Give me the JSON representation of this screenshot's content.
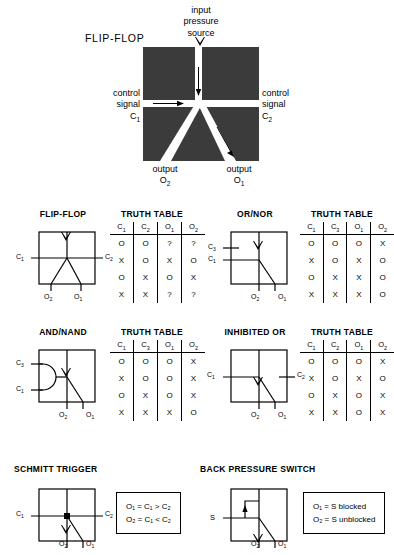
{
  "hero": {
    "title": "FLIP-FLOP",
    "input_label_line1": "input",
    "input_label_line2": "pressure",
    "input_label_line3": "source",
    "control_left_line1": "control",
    "control_left_line2": "signal",
    "control_left_line3": "C",
    "control_left_sub": "1",
    "control_right_line1": "control",
    "control_right_line2": "signal",
    "control_right_line3": "C",
    "control_right_sub": "2",
    "output_left_line1": "output",
    "output_left_line2": "O",
    "output_left_sub": "2",
    "output_right_line1": "output",
    "output_right_line2": "O",
    "output_right_sub": "1",
    "body_color": "#3b3b3b",
    "channel_color": "#ffffff"
  },
  "truth_table_heading": "TRUTH TABLE",
  "cells": {
    "flipflop": {
      "title": "FLIP-FLOP",
      "in_left": "C",
      "in_left_sub": "1",
      "in_right": "C",
      "in_right_sub": "2",
      "out_left": "O",
      "out_left_sub": "2",
      "out_right": "O",
      "out_right_sub": "1",
      "table": {
        "headers": [
          {
            "base": "C",
            "sub": "1"
          },
          {
            "base": "C",
            "sub": "2"
          },
          {
            "base": "O",
            "sub": "1"
          },
          {
            "base": "O",
            "sub": "2"
          }
        ],
        "rows": [
          [
            "O",
            "O",
            "?",
            "?"
          ],
          [
            "X",
            "O",
            "X",
            "O"
          ],
          [
            "O",
            "X",
            "O",
            "X"
          ],
          [
            "X",
            "X",
            "?",
            "?"
          ]
        ]
      }
    },
    "ornor": {
      "title": "OR/NOR",
      "in_upper": "C",
      "in_upper_sub": "3",
      "in_lower": "C",
      "in_lower_sub": "1",
      "out_left": "O",
      "out_left_sub": "2",
      "out_right": "O",
      "out_right_sub": "1",
      "table": {
        "headers": [
          {
            "base": "C",
            "sub": "1"
          },
          {
            "base": "C",
            "sub": "3"
          },
          {
            "base": "O",
            "sub": "1"
          },
          {
            "base": "O",
            "sub": "2"
          }
        ],
        "rows": [
          [
            "O",
            "O",
            "O",
            "X"
          ],
          [
            "X",
            "O",
            "X",
            "O"
          ],
          [
            "O",
            "X",
            "X",
            "O"
          ],
          [
            "X",
            "X",
            "X",
            "O"
          ]
        ]
      }
    },
    "andnand": {
      "title": "AND/NAND",
      "in_upper": "C",
      "in_upper_sub": "3",
      "in_lower": "C",
      "in_lower_sub": "1",
      "out_left": "O",
      "out_left_sub": "2",
      "out_right": "O",
      "out_right_sub": "1",
      "table": {
        "headers": [
          {
            "base": "C",
            "sub": "1"
          },
          {
            "base": "C",
            "sub": "3"
          },
          {
            "base": "O",
            "sub": "1"
          },
          {
            "base": "O",
            "sub": "2"
          }
        ],
        "rows": [
          [
            "O",
            "O",
            "O",
            "X"
          ],
          [
            "X",
            "O",
            "O",
            "X"
          ],
          [
            "O",
            "X",
            "O",
            "X"
          ],
          [
            "X",
            "X",
            "X",
            "O"
          ]
        ]
      }
    },
    "inhibited_or": {
      "title": "INHIBITED OR",
      "in_left": "C",
      "in_left_sub": "1",
      "in_right": "C",
      "in_right_sub": "2",
      "out_left": "O",
      "out_left_sub": "2",
      "out_right": "O",
      "out_right_sub": "1",
      "table": {
        "headers": [
          {
            "base": "C",
            "sub": "1"
          },
          {
            "base": "C",
            "sub": "2"
          },
          {
            "base": "O",
            "sub": "1"
          },
          {
            "base": "O",
            "sub": "2"
          }
        ],
        "rows": [
          [
            "O",
            "O",
            "O",
            "X"
          ],
          [
            "X",
            "O",
            "X",
            "O"
          ],
          [
            "O",
            "X",
            "O",
            "X"
          ],
          [
            "X",
            "X",
            "O",
            "X"
          ]
        ]
      }
    },
    "schmitt": {
      "title": "SCHMITT TRIGGER",
      "in_left": "C",
      "in_left_sub": "1",
      "in_right": "C",
      "in_right_sub": "2",
      "out_left": "O",
      "out_left_sub": "2",
      "out_right": "O",
      "out_right_sub": "1",
      "formula_line1": "O₁ = C₁ > C₂",
      "formula_line2": "O₂ = C₁ < C₂"
    },
    "backpressure": {
      "title": "BACK PRESSURE SWITCH",
      "in_left": "S",
      "out_left": "O",
      "out_left_sub": "2",
      "out_right": "O",
      "out_right_sub": "1",
      "formula_line1": "O₁ = S blocked",
      "formula_line2": "O₂ = S unblocked"
    }
  }
}
